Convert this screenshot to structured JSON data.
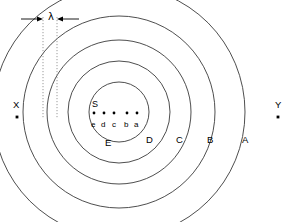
{
  "figure": {
    "type": "diagram",
    "background_color": "#ffffff",
    "stroke_color": "#3a3a3a",
    "text_color": "#000000",
    "wavelength": {
      "symbol": "λ",
      "guide_line_style": "dotted",
      "guide_line_color": "#9a9a9a",
      "left_guide_x": 43,
      "right_guide_x": 57,
      "guide_top_y": 17,
      "guide_bottom_y": 118,
      "arrow_y": 19,
      "left_arrow_from_x": 21,
      "right_arrow_from_x": 79
    },
    "center": {
      "x": 119,
      "y": 112
    },
    "rings": [
      {
        "label": "A",
        "radius": 126,
        "label_x": 242,
        "label_y": 139
      },
      {
        "label": "B",
        "radius": 96,
        "label_x": 207,
        "label_y": 139
      },
      {
        "label": "C",
        "radius": 72,
        "label_x": 176,
        "label_y": 139
      },
      {
        "label": "D",
        "radius": 51,
        "label_x": 146,
        "label_y": 139
      },
      {
        "label": "E",
        "radius": 30,
        "label_x": 106,
        "label_y": 142
      }
    ],
    "source_label": {
      "text": "S",
      "x": 92,
      "y": 100
    },
    "wave_dots": [
      {
        "label": "e",
        "x": 94,
        "y": 113
      },
      {
        "label": "d",
        "x": 104,
        "y": 113
      },
      {
        "label": "c",
        "x": 114,
        "y": 113
      },
      {
        "label": "b",
        "x": 127,
        "y": 113
      },
      {
        "label": "a",
        "x": 137,
        "y": 113
      }
    ],
    "wave_dot_labels_y": 124,
    "external_points": [
      {
        "label": "X",
        "label_x": 14,
        "label_y": 104,
        "dot_x": 17,
        "dot_y": 117
      },
      {
        "label": "Y",
        "label_x": 276,
        "label_y": 104,
        "dot_x": 278,
        "dot_y": 117
      }
    ]
  }
}
